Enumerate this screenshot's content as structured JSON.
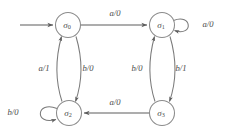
{
  "diagram": {
    "type": "finite-state-machine",
    "title": "",
    "canvas": {
      "width": 230,
      "height": 136
    },
    "colors": {
      "background": "#ffffff",
      "node_stroke": "#8c8c8c",
      "node_fill": "#ffffff",
      "edge_stroke": "#7a7a7a",
      "text": "#4a4a4a"
    },
    "states": [
      {
        "id": "s0",
        "name": "sigma-0",
        "base": "σ",
        "subscript": "0",
        "cx": 68,
        "cy": 25,
        "r": 12.5
      },
      {
        "id": "s1",
        "name": "sigma-1",
        "base": "σ",
        "subscript": "1",
        "cx": 162,
        "cy": 25,
        "r": 12.5
      },
      {
        "id": "s2",
        "name": "sigma-2",
        "base": "σ",
        "subscript": "2",
        "cx": 69,
        "cy": 113,
        "r": 12.5
      },
      {
        "id": "s3",
        "name": "sigma-3",
        "base": "σ",
        "subscript": "3",
        "cx": 162,
        "cy": 113,
        "r": 12.5
      }
    ],
    "initial_state": "s0",
    "transitions": [
      {
        "id": "t-s0-s1",
        "from": "s0",
        "to": "s1",
        "input": "a",
        "output": "0",
        "label": "a/0",
        "label_x": 115,
        "label_y": 14
      },
      {
        "id": "t-s0-s2",
        "from": "s0",
        "to": "s2",
        "input": "b",
        "output": "0",
        "label": "b/0",
        "label_x": 88,
        "label_y": 69
      },
      {
        "id": "t-s2-s0",
        "from": "s2",
        "to": "s0",
        "input": "a",
        "output": "1",
        "label": "a/1",
        "label_x": 44,
        "label_y": 69
      },
      {
        "id": "t-s1-s1",
        "from": "s1",
        "to": "s1",
        "input": "a",
        "output": "0",
        "label": "a/0",
        "label_x": 208,
        "label_y": 25
      },
      {
        "id": "t-s1-s3",
        "from": "s1",
        "to": "s3",
        "input": "b",
        "output": "1",
        "label": "b/1",
        "label_x": 181,
        "label_y": 69
      },
      {
        "id": "t-s3-s1",
        "from": "s3",
        "to": "s1",
        "input": "b",
        "output": "0",
        "label": "b/0",
        "label_x": 137,
        "label_y": 69
      },
      {
        "id": "t-s3-s2",
        "from": "s3",
        "to": "s2",
        "input": "a",
        "output": "0",
        "label": "a/0",
        "label_x": 115,
        "label_y": 103
      },
      {
        "id": "t-s2-s2",
        "from": "s2",
        "to": "s2",
        "input": "b",
        "output": "0",
        "label": "b/0",
        "label_x": 13,
        "label_y": 113
      }
    ]
  }
}
